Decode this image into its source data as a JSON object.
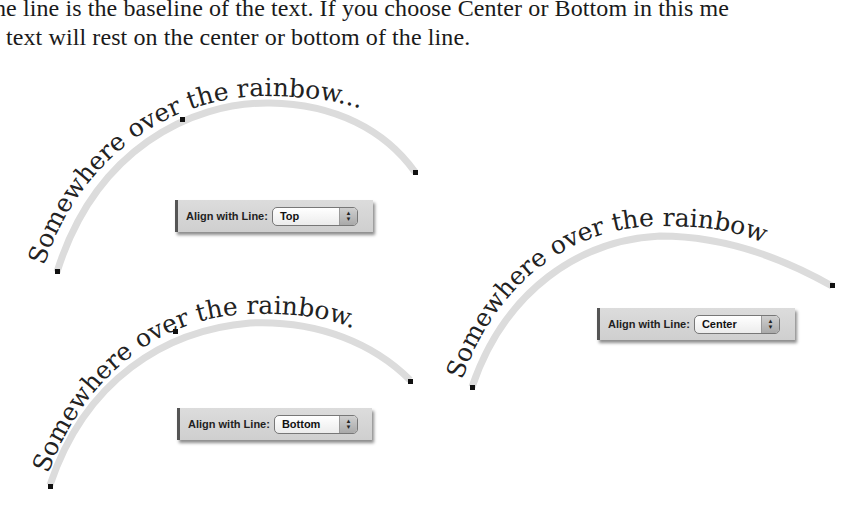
{
  "intro": {
    "line1": "he line is the baseline of the text. If you choose Center or Bottom in this me",
    "line2": "text will rest on the center or bottom of the line."
  },
  "examples": [
    {
      "id": "top",
      "curve_text": "Somewhere over the rainbow...",
      "label": "Align with Line:",
      "value": "Top"
    },
    {
      "id": "bottom",
      "curve_text": "Somewhere over the rainbow...",
      "label": "Align with Line:",
      "value": "Bottom"
    },
    {
      "id": "center",
      "curve_text": "Somewhere over the rainbow...",
      "label": "Align with Line:",
      "value": "Center"
    }
  ],
  "icons": {
    "popup_arrows": "up-down-chevron-icon"
  },
  "colors": {
    "curve_stroke": "#d9d9d9",
    "panel_bg": "#d6d6d6",
    "text": "#222222"
  }
}
